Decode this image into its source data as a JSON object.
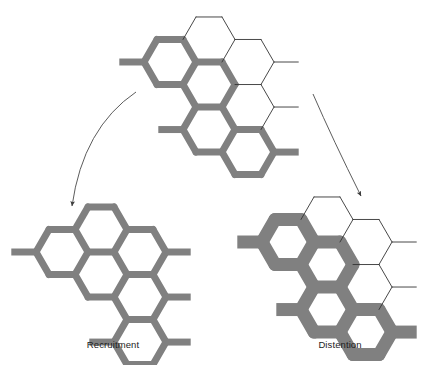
{
  "figure": {
    "background_color": "#ffffff",
    "vessel_open_color": "#808080",
    "vessel_closed_color": "#ffffff",
    "vessel_outline_color": "#333333",
    "arrow_color": "#4a4a4a",
    "label_color": "#1c1c1c"
  },
  "labels": {
    "left": "Recruitment",
    "right": "Distention"
  },
  "panels": [
    {
      "id": "baseline",
      "name": "baseline-capillary-bed",
      "caption": "",
      "wall_thickness": 7,
      "hex_radius": 26,
      "origin_x": 170,
      "origin_y": 62,
      "open_cells": [
        {
          "col": 0,
          "row": 0
        },
        {
          "col": 1,
          "row": 0
        },
        {
          "col": 1,
          "row": 1
        },
        {
          "col": 2,
          "row": 1
        }
      ],
      "closed_cells": [
        {
          "col": 1,
          "row": -1
        },
        {
          "col": 2,
          "row": 0
        },
        {
          "col": 2,
          "row": -1
        }
      ]
    },
    {
      "id": "recruitment",
      "name": "recruitment-capillary-bed",
      "caption": "Recruitment",
      "wall_thickness": 7,
      "hex_radius": 26,
      "origin_x": 62,
      "origin_y": 252,
      "open_cells": [
        {
          "col": 0,
          "row": 0
        },
        {
          "col": 1,
          "row": -1
        },
        {
          "col": 1,
          "row": 0
        },
        {
          "col": 2,
          "row": -1
        },
        {
          "col": 2,
          "row": 0
        },
        {
          "col": 2,
          "row": 1
        }
      ],
      "closed_cells": []
    },
    {
      "id": "distention",
      "name": "distention-capillary-bed",
      "caption": "Distention",
      "wall_thickness": 13,
      "hex_radius": 26,
      "origin_x": 288,
      "origin_y": 242,
      "open_cells": [
        {
          "col": 0,
          "row": 0
        },
        {
          "col": 1,
          "row": 0
        },
        {
          "col": 1,
          "row": 1
        },
        {
          "col": 2,
          "row": 1
        }
      ],
      "closed_cells": [
        {
          "col": 1,
          "row": -1
        },
        {
          "col": 2,
          "row": 0
        },
        {
          "col": 2,
          "row": -1
        }
      ]
    }
  ],
  "arrows": [
    {
      "name": "arrow-to-recruitment",
      "from_x": 136,
      "from_y": 92,
      "ctrl_x": 83,
      "ctrl_y": 128,
      "to_x": 72,
      "to_y": 206
    },
    {
      "name": "arrow-to-distention",
      "from_x": 313,
      "from_y": 94,
      "ctrl_x": 333,
      "ctrl_y": 140,
      "to_x": 361,
      "to_y": 196
    }
  ]
}
